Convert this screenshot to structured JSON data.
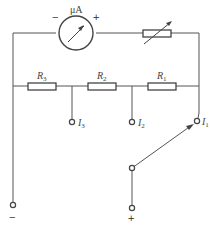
{
  "diagram": {
    "type": "circuit-schematic",
    "title": "",
    "meter": {
      "label": "μA",
      "minus_sign": "−",
      "plus_sign": "+",
      "icon": "microammeter-icon"
    },
    "rheostat": {
      "icon": "variable-resistor-icon"
    },
    "resistors": [
      {
        "id": "R3",
        "name": "R",
        "sub": "3"
      },
      {
        "id": "R2",
        "name": "R",
        "sub": "2"
      },
      {
        "id": "R1",
        "name": "R",
        "sub": "1"
      }
    ],
    "taps": [
      {
        "id": "I3",
        "name": "I",
        "sub": "3"
      },
      {
        "id": "I2",
        "name": "I",
        "sub": "2"
      },
      {
        "id": "I1",
        "name": "I",
        "sub": "1"
      }
    ],
    "switch": {
      "icon": "selector-switch-icon",
      "selected_tap": "I1"
    },
    "terminals": {
      "negative": "−",
      "positive": "+"
    },
    "colors": {
      "line": "#555555",
      "text": "#444444",
      "background": "#ffffff"
    }
  }
}
